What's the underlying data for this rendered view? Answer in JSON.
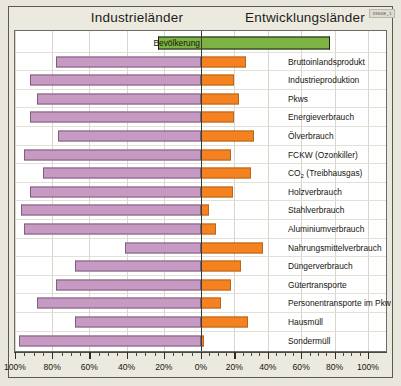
{
  "header": {
    "left_title": "Industrieländer",
    "right_title": "Entwicklungsländer",
    "code": "3966E_1"
  },
  "axis": {
    "ticks": [
      "100%",
      "80%",
      "60%",
      "40%",
      "20%",
      "0%",
      "20%",
      "40%",
      "60%",
      "80%",
      "100%"
    ],
    "tick_values": [
      -100,
      -80,
      -60,
      -40,
      -20,
      0,
      20,
      40,
      60,
      80,
      100
    ]
  },
  "colors": {
    "left_bar": "#c79ac3",
    "left_bar_border": "#7d5f7b",
    "right_bar": "#f58220",
    "right_bar_border": "#b5661f",
    "population_bar": "#7cb342",
    "population_bar_border": "#1d1d1a",
    "zero_line": "#3a3a36",
    "page_background": "#e9e6dd",
    "plot_background": "#ffffff"
  },
  "chart_data": {
    "type": "bar",
    "title": "",
    "subtitle": "",
    "orientation": "horizontal",
    "layout": "diverging-dual-sided",
    "xlabel": "",
    "ylabel": "",
    "xlim": [
      -100,
      100
    ],
    "grid": true,
    "legend_position": "none",
    "series": [
      {
        "name": "Industrieländer",
        "side": "left",
        "color": "#c79ac3"
      },
      {
        "name": "Entwicklungsländer",
        "side": "right",
        "color": "#f58220"
      }
    ],
    "categories": [
      "Bevölkerung",
      "Bruttoinlandsprodukt",
      "Industrieproduktion",
      "Pkws",
      "Energieverbrauch",
      "Ölverbrauch",
      "FCKW (Ozonkiller)",
      "CO2 (Treibhausgas)",
      "Holzverbrauch",
      "Stahlverbrauch",
      "Aluminiumverbrauch",
      "Nahrungsmittelverbrauch",
      "Düngerverbrauch",
      "Gütertransporte",
      "Personentransporte im Pkw",
      "Hausmüll",
      "Sondermüll"
    ],
    "rows": [
      {
        "label": "Bevölkerung",
        "label_html": "Bevölkerung",
        "left": 23,
        "right": 77,
        "highlight": true,
        "label_inline": true
      },
      {
        "label": "Bruttoinlandsprodukt",
        "label_html": "Bruttoinlandsprodukt",
        "left": 78,
        "right": 27,
        "highlight": false,
        "label_inline": false
      },
      {
        "label": "Industrieproduktion",
        "label_html": "Industrieproduktion",
        "left": 92,
        "right": 20,
        "highlight": false,
        "label_inline": false
      },
      {
        "label": "Pkws",
        "label_html": "Pkws",
        "left": 88,
        "right": 23,
        "highlight": false,
        "label_inline": false
      },
      {
        "label": "Energieverbrauch",
        "label_html": "Energieverbrauch",
        "left": 92,
        "right": 20,
        "highlight": false,
        "label_inline": false
      },
      {
        "label": "Ölverbrauch",
        "label_html": "Ölverbrauch",
        "left": 77,
        "right": 32,
        "highlight": false,
        "label_inline": false
      },
      {
        "label": "FCKW (Ozonkiller)",
        "label_html": "FCKW (Ozonkiller)",
        "left": 95,
        "right": 18,
        "highlight": false,
        "label_inline": false
      },
      {
        "label": "CO2 (Treibhausgas)",
        "label_html": "CO<sub>2</sub> (Treibhausgas)",
        "left": 85,
        "right": 30,
        "highlight": false,
        "label_inline": false
      },
      {
        "label": "Holzverbrauch",
        "label_html": "Holzverbrauch",
        "left": 92,
        "right": 19,
        "highlight": false,
        "label_inline": false
      },
      {
        "label": "Stahlverbrauch",
        "label_html": "Stahlverbrauch",
        "left": 97,
        "right": 5,
        "highlight": false,
        "label_inline": false
      },
      {
        "label": "Aluminiumverbrauch",
        "label_html": "Aluminiumverbrauch",
        "left": 95,
        "right": 9,
        "highlight": false,
        "label_inline": false
      },
      {
        "label": "Nahrungsmittelverbrauch",
        "label_html": "Nahrungsmittelverbrauch",
        "left": 41,
        "right": 37,
        "highlight": false,
        "label_inline": false
      },
      {
        "label": "Düngerverbrauch",
        "label_html": "Düngerverbrauch",
        "left": 68,
        "right": 24,
        "highlight": false,
        "label_inline": false
      },
      {
        "label": "Gütertransporte",
        "label_html": "Gütertransporte",
        "left": 78,
        "right": 18,
        "highlight": false,
        "label_inline": false
      },
      {
        "label": "Personentransporte im Pkw",
        "label_html": "Personentransporte im Pkw",
        "left": 88,
        "right": 12,
        "highlight": false,
        "label_inline": false
      },
      {
        "label": "Hausmüll",
        "label_html": "Hausmüll",
        "left": 68,
        "right": 28,
        "highlight": false,
        "label_inline": false
      },
      {
        "label": "Sondermüll",
        "label_html": "Sondermüll",
        "left": 98,
        "right": 2,
        "highlight": false,
        "label_inline": false
      }
    ]
  }
}
